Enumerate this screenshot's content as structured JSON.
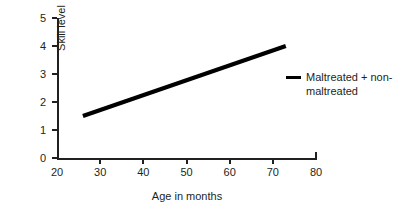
{
  "chart_data": {
    "type": "line",
    "title": "",
    "xlabel": "Age in months",
    "ylabel": "Skill level",
    "xlim": [
      20,
      80
    ],
    "ylim": [
      0,
      5
    ],
    "xticks": [
      20,
      30,
      40,
      50,
      60,
      70,
      80
    ],
    "xtick_labels": [
      "20",
      "30",
      "40",
      "50",
      "60",
      "70",
      "80"
    ],
    "yticks": [
      0,
      1,
      2,
      3,
      4,
      5
    ],
    "ytick_labels": [
      "0",
      "1",
      "2",
      "3",
      "4",
      "5"
    ],
    "grid": false,
    "legend_position": "right",
    "series": [
      {
        "name": "Maltreated + non-maltreated",
        "color": "#000000",
        "line_width": 4,
        "x": [
          26,
          73
        ],
        "y": [
          1.5,
          4.0
        ]
      }
    ],
    "annotations": []
  },
  "legend": {
    "entries": [
      {
        "label": "Maltreated + non-maltreated"
      }
    ]
  }
}
